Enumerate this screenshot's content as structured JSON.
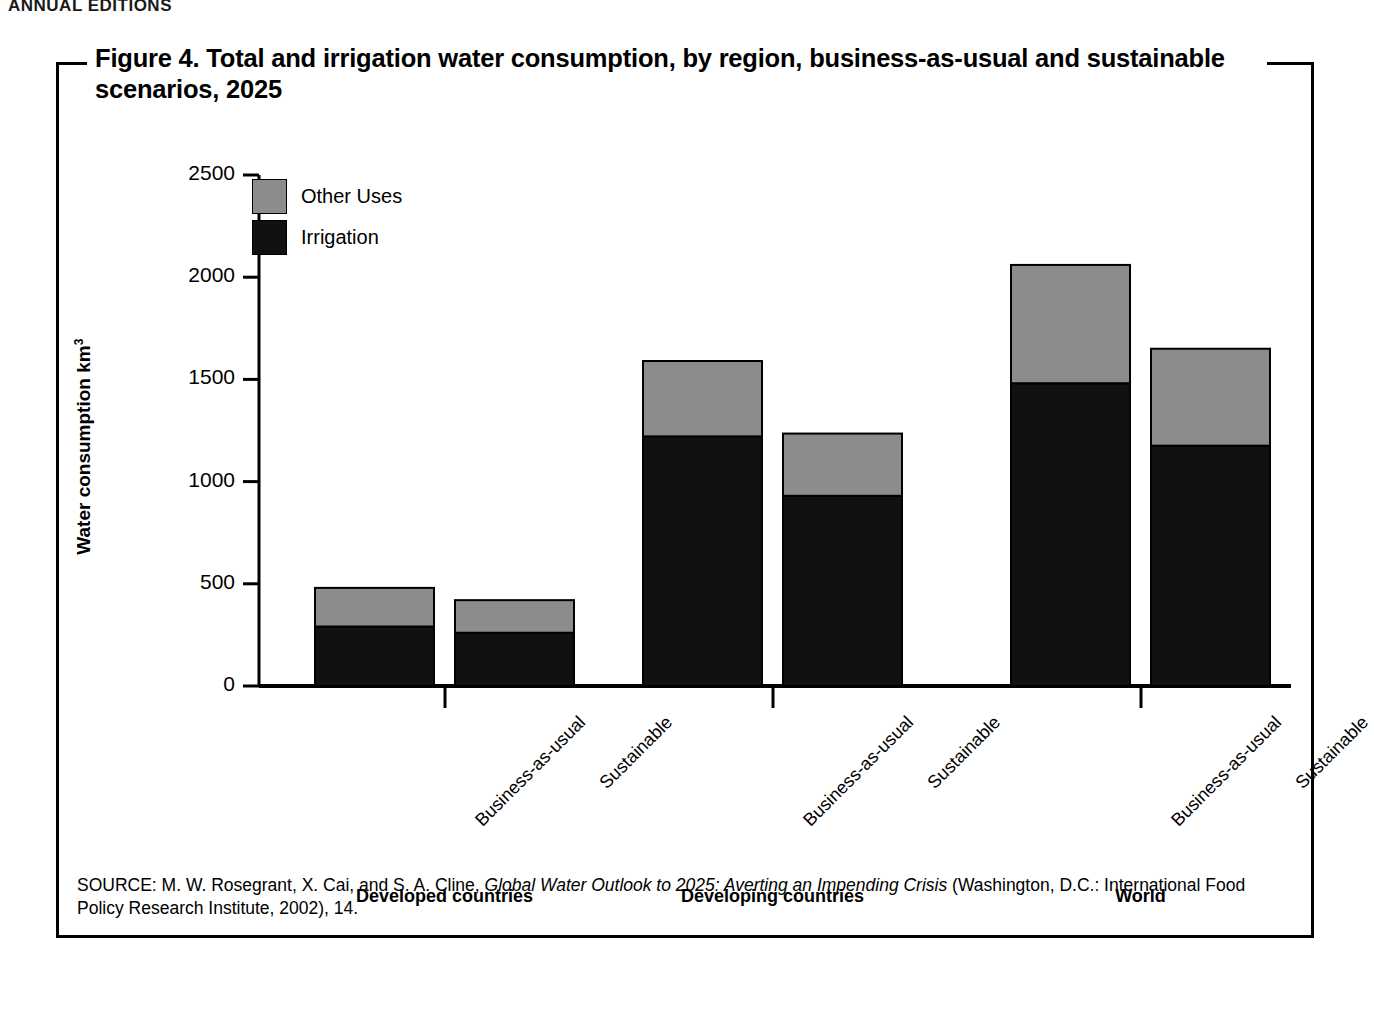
{
  "running_head": "ANNUAL EDITIONS",
  "figure": {
    "title": "Figure 4. Total and irrigation water consumption, by region, business-as-usual and sustainable scenarios, 2025",
    "source_prefix": "SOURCE: M. W. Rosegrant, X. Cai, and S. A. Cline, ",
    "source_italic": "Global Water Outlook to 2025: Averting an Impending Crisis",
    "source_suffix": " (Washington, D.C.: International Food Policy Research Institute, 2002), 14."
  },
  "colors": {
    "irrigation": "#111111",
    "other_uses": "#8c8c8c",
    "axis": "#000000",
    "background": "#ffffff"
  },
  "chart_data": {
    "type": "bar",
    "stacked": true,
    "title": "Figure 4. Total and irrigation water consumption, by region, business-as-usual and sustainable scenarios, 2025",
    "xlabel": "",
    "ylabel": "Water consumption km³",
    "ylim": [
      0,
      2500
    ],
    "yticks": [
      0,
      500,
      1000,
      1500,
      2000,
      2500
    ],
    "ytick_labels": [
      "0",
      "500",
      "1000",
      "1500",
      "2000",
      "2500"
    ],
    "grid": false,
    "legend_position": "upper-left-inside",
    "legend": [
      "Other Uses",
      "Irrigation"
    ],
    "groups": [
      "Developed countries",
      "Developing countries",
      "World"
    ],
    "categories": [
      "Business-as-usual",
      "Sustainable",
      "Business-as-usual",
      "Sustainable",
      "Business-as-usual",
      "Sustainable"
    ],
    "series": [
      {
        "name": "Irrigation",
        "color": "#111111",
        "values": [
          290,
          260,
          1220,
          930,
          1480,
          1175
        ]
      },
      {
        "name": "Other Uses",
        "color": "#8c8c8c",
        "values": [
          190,
          160,
          370,
          305,
          580,
          475
        ]
      }
    ],
    "totals": [
      480,
      420,
      1590,
      1235,
      2060,
      1650
    ],
    "bars": [
      {
        "group": "Developed countries",
        "scenario": "Business-as-usual",
        "irrigation": 290,
        "other_uses": 190,
        "total": 480
      },
      {
        "group": "Developed countries",
        "scenario": "Sustainable",
        "irrigation": 260,
        "other_uses": 160,
        "total": 420
      },
      {
        "group": "Developing countries",
        "scenario": "Business-as-usual",
        "irrigation": 1220,
        "other_uses": 370,
        "total": 1590
      },
      {
        "group": "Developing countries",
        "scenario": "Sustainable",
        "irrigation": 930,
        "other_uses": 305,
        "total": 1235
      },
      {
        "group": "World",
        "scenario": "Business-as-usual",
        "irrigation": 1480,
        "other_uses": 580,
        "total": 2060
      },
      {
        "group": "World",
        "scenario": "Sustainable",
        "irrigation": 1175,
        "other_uses": 475,
        "total": 1650
      }
    ]
  }
}
